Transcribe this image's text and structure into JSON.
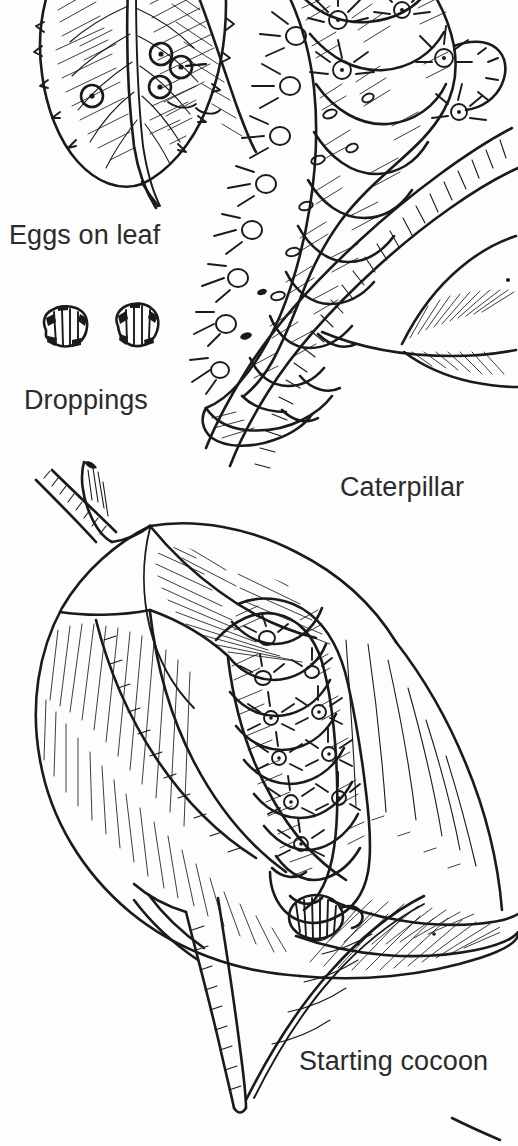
{
  "page": {
    "background_color": "#fdfdfd",
    "ink_color": "#1a1a1a",
    "text_color": "#2b2b2b",
    "width": 518,
    "height": 1146
  },
  "labels": {
    "eggs_on_leaf": "Eggs on leaf",
    "droppings": "Droppings",
    "caterpillar": "Caterpillar",
    "starting_cocoon": "Starting cocoon"
  },
  "figures": [
    {
      "id": "eggs-on-leaf",
      "name": "eggs-on-leaf-illustration",
      "caption": "Eggs on leaf",
      "description": "Pen-and-ink serrated leaf with central midrib and four round eggs, each a ring with a center dot",
      "egg_count": 4
    },
    {
      "id": "droppings",
      "name": "droppings-illustration",
      "caption": "Droppings",
      "description": "Two small irregular dark frass pellets side by side",
      "pellet_count": 2
    },
    {
      "id": "caterpillar",
      "name": "caterpillar-illustration",
      "caption": "Caterpillar",
      "description": "Large segmented caterpillar with spiny star-shaped tubercles clinging to a branch with leaves"
    },
    {
      "id": "starting-cocoon",
      "name": "starting-cocoon-illustration",
      "caption": "Starting cocoon",
      "description": "Caterpillar curling inside a folded leaf while beginning to spin its cocoon, attached to a stem"
    }
  ]
}
